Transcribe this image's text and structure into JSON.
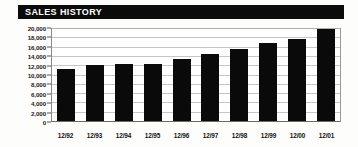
{
  "header": {
    "title": "SALES HISTORY"
  },
  "chart_data": {
    "type": "bar",
    "title": "SALES HISTORY",
    "xlabel": "",
    "ylabel": "",
    "categories": [
      "12/92",
      "12/93",
      "12/94",
      "12/95",
      "12/96",
      "12/97",
      "12/98",
      "12/99",
      "12/00",
      "12/01"
    ],
    "values": [
      11100,
      12000,
      12300,
      12300,
      13300,
      14500,
      15400,
      16800,
      17600,
      19700
    ],
    "ylim": [
      0,
      20000
    ],
    "ytick_values": [
      0,
      2000,
      4000,
      6000,
      8000,
      10000,
      12000,
      14000,
      16000,
      18000,
      20000
    ],
    "ytick_labels": [
      "0",
      "2,000",
      "4,000",
      "6,000",
      "8,000",
      "10,000",
      "12,000",
      "14,000",
      "16,000",
      "18,000",
      "20,000"
    ],
    "grid": true,
    "legend": false,
    "bar_color": "#0a0a0a",
    "grid_color": "#c6c6c6",
    "background_color": "#ffffff"
  }
}
